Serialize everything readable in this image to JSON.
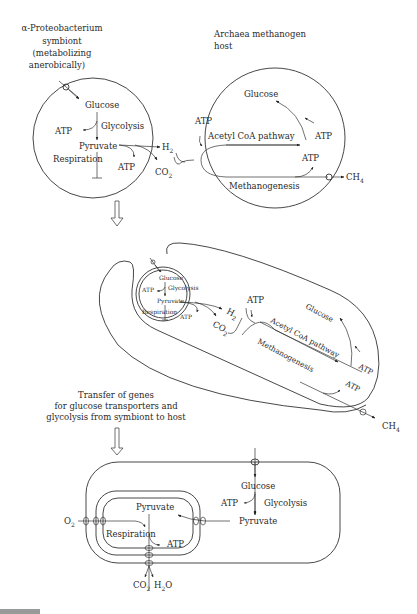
{
  "panel1": {
    "symbiont_title": [
      "α-Proteobacterium",
      "symbiont",
      "(metabolizing",
      "anerobically)"
    ],
    "host_title": [
      "Archaea methanogen",
      "host"
    ],
    "symbiont": {
      "glucose": "Glucose",
      "glycolysis": "Glycolysis",
      "atp_left": "ATP",
      "pyruvate": "Pyruvate",
      "respiration": "Respiration",
      "atp_bottom": "ATP"
    },
    "h2": "H",
    "h2_sub": "2",
    "co2": "CO",
    "co2_sub": "2",
    "host": {
      "glucose": "Glucose",
      "atp_top_left": "ATP",
      "acetyl": "Acetyl CoA pathway",
      "atp_right": "ATP",
      "atp_lower": "ATP",
      "methanogenesis": "Methanogenesis"
    },
    "ch4": "CH",
    "ch4_sub": "4"
  },
  "panel2": {
    "symbiont": {
      "glucose": "Glucose",
      "glycolysis": "Glycolysis",
      "atp_left": "ATP",
      "pyruvate": "Pyruvate",
      "respiration": "Respiration",
      "atp_bottom": "ATP"
    },
    "h2": "H",
    "h2_sub": "2",
    "co2": "CO",
    "co2_sub": "2",
    "host": {
      "atp_top": "ATP",
      "glucose": "Glucose",
      "acetyl": "Acetyl CoA pathway",
      "atp_right": "ATP",
      "atp_lower": "ATP",
      "methanogenesis": "Methanogenesis"
    },
    "ch4": "CH",
    "ch4_sub": "4"
  },
  "transfer_caption": [
    "Transfer of genes",
    "for glucose transporters and",
    "glycolysis from symbiont to host"
  ],
  "panel3": {
    "glucose": "Glucose",
    "atp_glycolysis": "ATP",
    "glycolysis": "Glycolysis",
    "pyruvate_cytosol": "Pyruvate",
    "pyruvate_mito": "Pyruvate",
    "respiration": "Respiration",
    "atp_mito": "ATP",
    "o2": "O",
    "o2_sub": "2",
    "co2": "CO",
    "co2_sub": "2",
    "h2o_h": "H",
    "h2o_sub": "2",
    "h2o_o": "O"
  }
}
